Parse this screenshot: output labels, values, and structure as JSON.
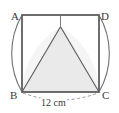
{
  "figure": {
    "type": "geometry-diagram",
    "vertices": [
      {
        "name": "A",
        "label": "A",
        "position": "top-left"
      },
      {
        "name": "D",
        "label": "D",
        "position": "top-right"
      },
      {
        "name": "B",
        "label": "B",
        "position": "bottom-left"
      },
      {
        "name": "C",
        "label": "C",
        "position": "bottom-right"
      }
    ],
    "dimension": {
      "label": "12 cm",
      "value": 12,
      "unit": "cm",
      "measures": "BC",
      "style": "dashed"
    },
    "colors": {
      "outline": "#4a4a4a",
      "shaded_fill": "#e6e6e6",
      "arc_stroke": "#6e6e6e",
      "label_text": "#3a3a3a",
      "background": "#ffffff"
    }
  }
}
